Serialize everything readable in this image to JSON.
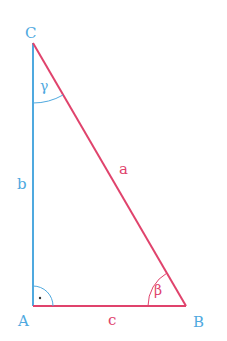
{
  "diagram": {
    "colors": {
      "blue": "#4fa9df",
      "red": "#e0436c",
      "background": "#ffffff"
    },
    "vertices": {
      "A": {
        "label": "A",
        "x": 33,
        "y": 306
      },
      "B": {
        "label": "B",
        "x": 186,
        "y": 306
      },
      "C": {
        "label": "C",
        "x": 33,
        "y": 43
      }
    },
    "sides": {
      "a": {
        "label": "a",
        "from": "B",
        "to": "C"
      },
      "b": {
        "label": "b",
        "from": "A",
        "to": "C"
      },
      "c": {
        "label": "c",
        "from": "A",
        "to": "B"
      }
    },
    "angles": {
      "alpha": {
        "label": "·",
        "vertex": "A",
        "note": "right angle marker"
      },
      "beta": {
        "label": "β",
        "vertex": "B"
      },
      "gamma": {
        "label": "γ",
        "vertex": "C"
      }
    }
  }
}
